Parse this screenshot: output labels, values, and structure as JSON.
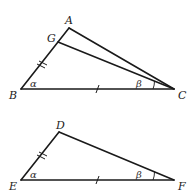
{
  "figure": {
    "triangle_top": {
      "vertices": {
        "A": {
          "label": "A",
          "x": 69,
          "y": 28
        },
        "G": {
          "label": "G",
          "x": 58,
          "y": 42
        },
        "B": {
          "label": "B",
          "x": 21,
          "y": 89
        },
        "C": {
          "label": "C",
          "x": 174,
          "y": 89
        }
      },
      "segments": [
        "AB",
        "AC",
        "BC",
        "GC"
      ],
      "angle_labels": {
        "at_B": "α",
        "at_C": "β"
      },
      "tick_marks": {
        "BG": 2,
        "BC": 1
      }
    },
    "triangle_bottom": {
      "vertices": {
        "D": {
          "label": "D",
          "x": 59,
          "y": 132
        },
        "E": {
          "label": "E",
          "x": 21,
          "y": 180
        },
        "F": {
          "label": "F",
          "x": 174,
          "y": 180
        }
      },
      "segments": [
        "DE",
        "DF",
        "EF"
      ],
      "angle_labels": {
        "at_E": "α",
        "at_F": "β"
      },
      "tick_marks": {
        "ED": 2,
        "EF": 1
      }
    }
  },
  "labels": {
    "A": "A",
    "G": "G",
    "B": "B",
    "C": "C",
    "D": "D",
    "E": "E",
    "F": "F",
    "alpha": "α",
    "beta": "β"
  },
  "colors": {
    "stroke": "#1a1a1a",
    "background": "#ffffff"
  }
}
